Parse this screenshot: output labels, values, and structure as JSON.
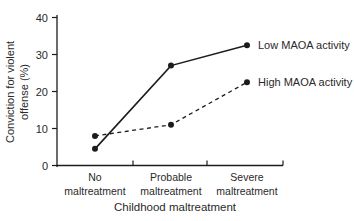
{
  "figure": {
    "background_color": "#ffffff",
    "ink_color": "#1c1c1c",
    "text_color": "#2a2a2a"
  },
  "chart_data": {
    "type": "line",
    "title": "",
    "xlabel": "Childhood maltreatment",
    "ylabel": "Conviction for violent offense (%)",
    "ylabel_lines": [
      "Conviction for violent",
      "offense (%)"
    ],
    "categories": [
      "No maltreatment",
      "Probable maltreatment",
      "Severe maltreatment"
    ],
    "category_lines": [
      [
        "No",
        "maltreatment"
      ],
      [
        "Probable",
        "maltreatment"
      ],
      [
        "Severe",
        "maltreatment"
      ]
    ],
    "y_ticks": [
      0,
      10,
      20,
      30,
      40
    ],
    "ylim": [
      0,
      40
    ],
    "grid": false,
    "legend_position": "labels-at-line-ends",
    "series": [
      {
        "name": "Low MAOA activity",
        "line_style": "solid",
        "marker": "filled-circle",
        "values": [
          4.5,
          27,
          32.5
        ]
      },
      {
        "name": "High MAOA activity",
        "line_style": "dashed",
        "marker": "filled-circle",
        "values": [
          8,
          11,
          22.5
        ]
      }
    ]
  }
}
